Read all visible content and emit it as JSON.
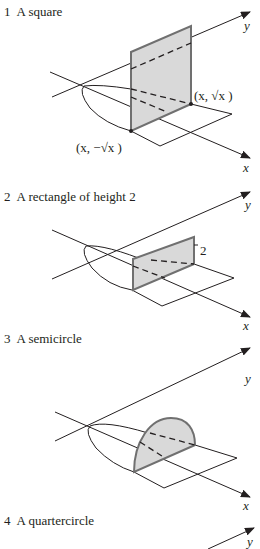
{
  "figures": [
    {
      "number": "1",
      "title": "A square",
      "axis_x": "x",
      "axis_y": "y",
      "point_upper": "(x, √x )",
      "point_lower": "(x, −√x )",
      "cross_section": "square"
    },
    {
      "number": "2",
      "title": "A rectangle of height 2",
      "axis_x": "x",
      "axis_y": "y",
      "height_label": "2",
      "cross_section": "rectangle"
    },
    {
      "number": "3",
      "title": "A semicircle",
      "axis_x": "x",
      "axis_y": "y",
      "cross_section": "semicircle"
    },
    {
      "number": "4",
      "title": "A quartercircle",
      "axis_y": "y",
      "cross_section": "quartercircle"
    }
  ],
  "colors": {
    "fill": "#d9d9d9",
    "outline": "#707070",
    "ink": "#231f20"
  }
}
